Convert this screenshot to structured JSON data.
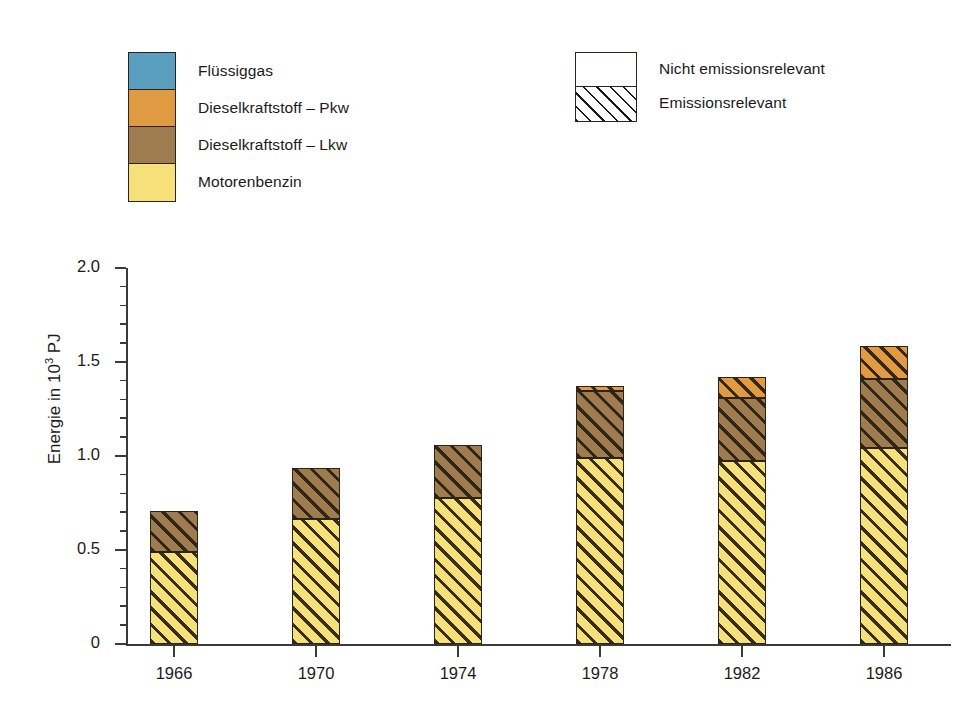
{
  "legend_fuels": {
    "name": "fuel-type-legend",
    "items": [
      {
        "label": "Flüssiggas",
        "color": "#5b9fc0",
        "key": "fluessiggas"
      },
      {
        "label": "Dieselkraftstoff – Pkw",
        "color": "#e09a42",
        "key": "diesel-pkw"
      },
      {
        "label": "Dieselkraftstoff – Lkw",
        "color": "#9e7c50",
        "key": "diesel-lkw"
      },
      {
        "label": "Motorenbenzin",
        "color": "#f5e07a",
        "key": "motorenbenzin"
      }
    ]
  },
  "legend_pattern": {
    "name": "emission-relevance-legend",
    "items": [
      {
        "label": "Nicht emissionsrelevant",
        "pattern": "solid-white"
      },
      {
        "label": "Emissionsrelevant",
        "pattern": "diagonal-hatch"
      }
    ]
  },
  "axis": {
    "y_label_text": "Energie in 10",
    "y_label_sup": "3",
    "y_label_unit": " PJ",
    "y_ticks": [
      "2.0",
      "1.5",
      "1.0",
      "0.5",
      "0"
    ],
    "x_ticks": [
      "1966",
      "1970",
      "1974",
      "1978",
      "1982",
      "1986"
    ]
  },
  "chart_data": {
    "type": "bar",
    "stacked": true,
    "title": "",
    "xlabel": "",
    "ylabel": "Energie in 10^3 PJ",
    "ylim": [
      0,
      2.0
    ],
    "yticks": [
      0,
      0.5,
      1.0,
      1.5,
      2.0
    ],
    "grid": false,
    "legend_position": "top",
    "categories": [
      "1966",
      "1970",
      "1974",
      "1978",
      "1982",
      "1986"
    ],
    "series": [
      {
        "name": "Motorenbenzin",
        "color": "#f5e07a",
        "hatched": true,
        "values": [
          0.49,
          0.665,
          0.775,
          0.99,
          0.975,
          1.04
        ]
      },
      {
        "name": "Dieselkraftstoff – Lkw",
        "color": "#9e7c50",
        "hatched": true,
        "values": [
          0.22,
          0.27,
          0.285,
          0.355,
          0.335,
          0.37
        ]
      },
      {
        "name": "Dieselkraftstoff – Pkw",
        "color": "#e09a42",
        "hatched": true,
        "values": [
          0.0,
          0.0,
          0.0,
          0.03,
          0.11,
          0.175
        ]
      },
      {
        "name": "Flüssiggas",
        "color": "#5b9fc0",
        "hatched": true,
        "values": [
          0.0,
          0.0,
          0.0,
          0.0,
          0.0,
          0.0
        ]
      }
    ],
    "totals": [
      0.71,
      0.935,
      1.06,
      1.375,
      1.42,
      1.585
    ]
  }
}
